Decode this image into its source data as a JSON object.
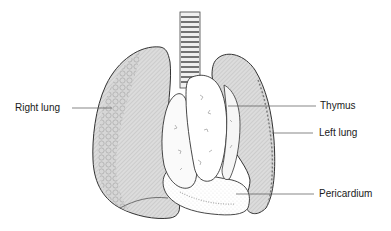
{
  "diagram": {
    "type": "anatomical-illustration",
    "colors": {
      "outline": "#333333",
      "lung_fill": "#d4d4d4",
      "organ_fill": "#ffffff",
      "leader_line": "#555555",
      "text": "#1a1a1a"
    },
    "labels": [
      {
        "id": "right-lung",
        "text": "Right lung",
        "side": "left"
      },
      {
        "id": "thymus",
        "text": "Thymus",
        "side": "right"
      },
      {
        "id": "left-lung",
        "text": "Left lung",
        "side": "right"
      },
      {
        "id": "pericardium",
        "text": "Pericardium",
        "side": "right"
      }
    ]
  }
}
